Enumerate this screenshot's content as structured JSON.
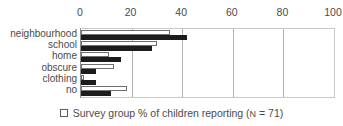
{
  "chart_data": {
    "type": "bar",
    "orientation": "horizontal",
    "title": "",
    "subtitle": "",
    "xlabel": "",
    "ylabel": "",
    "xlim": [
      0,
      100
    ],
    "xticks": [
      0,
      20,
      40,
      60,
      80,
      100
    ],
    "xtick_labels": [
      "0",
      "20",
      "40",
      "60",
      "80",
      "100"
    ],
    "grid": true,
    "grid_axis": "x",
    "legend_position": "bottom",
    "categories": [
      "neighbourhood",
      "school",
      "home",
      "obscure",
      "clothing",
      "no"
    ],
    "series": [
      {
        "name": "Survey group % of children reporting (N = 71)",
        "style": "white-outlined",
        "color": "#ffffff",
        "edge_color": "#6f6f6f",
        "values": [
          35,
          30,
          11,
          13,
          1,
          18
        ]
      },
      {
        "name": "children reporting",
        "style": "solid-black",
        "color": "#1c1c1c",
        "edge_color": "#1c1c1c",
        "values": [
          42,
          28,
          16,
          6,
          6,
          12
        ]
      }
    ],
    "legend_entries": [
      {
        "swatch": "white-square-outline",
        "label": "Survey group % of children reporting (",
        "n_symbol": "N",
        "n_text": " = 71)"
      }
    ]
  },
  "colors": {
    "axis": "#8d8d8d",
    "gridline": "#b0b0b0",
    "text": "#4a4a4a",
    "bar_black": "#1c1c1c",
    "bar_white": "#ffffff",
    "background": "#ffffff"
  }
}
